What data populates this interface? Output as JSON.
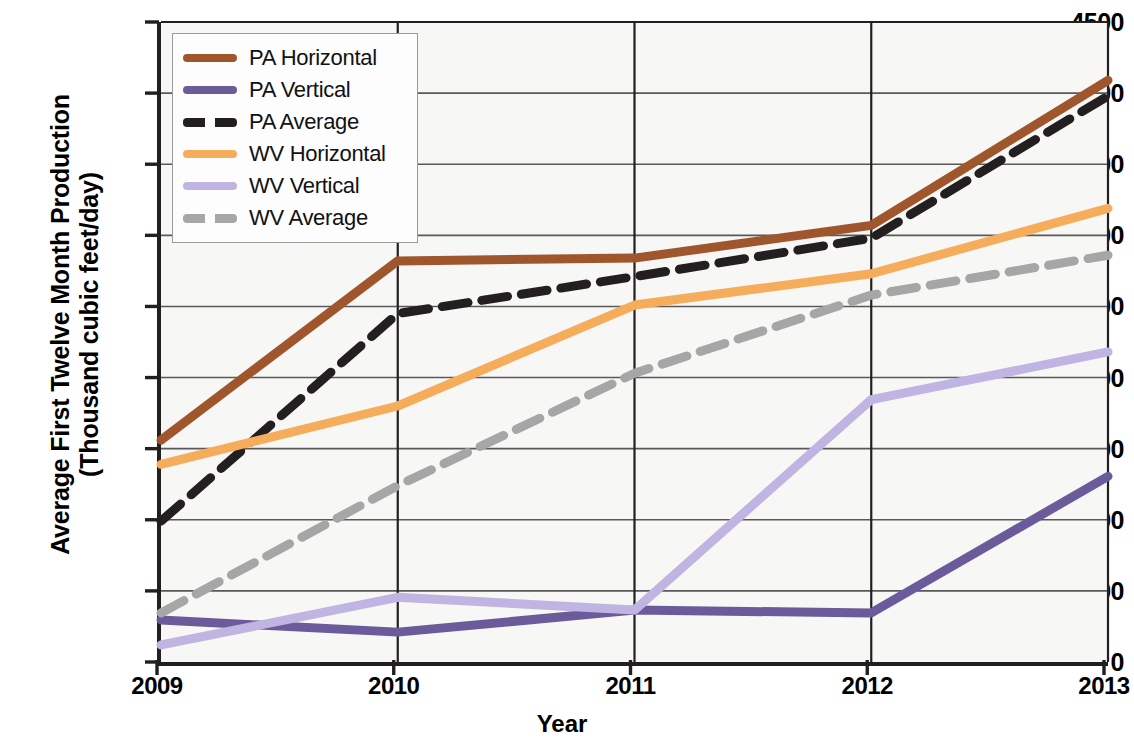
{
  "chart_data": {
    "type": "line",
    "title": "",
    "xlabel": "Year",
    "ylabel": "Average First Twelve Month Production (Thousand cubic feet/day)",
    "ylabel_line1": "Average First Twelve Month Production",
    "ylabel_line2": "(Thousand cubic feet/day)",
    "categories": [
      "2009",
      "2010",
      "2011",
      "2012",
      "2013"
    ],
    "x": [
      2009,
      2010,
      2011,
      2012,
      2013
    ],
    "xlim": [
      2009,
      2013
    ],
    "ylim": [
      0,
      4500
    ],
    "yticks": [
      4500,
      4000,
      3500,
      3000,
      2500,
      2000,
      1500,
      1000,
      500,
      0
    ],
    "ytick_labels": [
      "4500",
      "4000",
      "3500",
      "3000",
      "2500",
      "2000",
      "1500",
      "1000",
      "500",
      "0"
    ],
    "xticks": [
      2009,
      2010,
      2011,
      2012,
      2013
    ],
    "xtick_labels": [
      "2009",
      "2010",
      "2011",
      "2012",
      "2013"
    ],
    "grid": "horizontal",
    "legend_position": "top-left",
    "series": [
      {
        "name": "PA Horizontal",
        "color": "#a0562c",
        "style": "solid",
        "width": 9,
        "values": [
          1560,
          2820,
          2840,
          3070,
          4090
        ]
      },
      {
        "name": "PA Vertical",
        "color": "#6b5b9a",
        "style": "solid",
        "width": 9,
        "values": [
          295,
          210,
          365,
          345,
          1305
        ]
      },
      {
        "name": "PA Average",
        "color": "#231f20",
        "style": "dashed",
        "width": 9,
        "values": [
          990,
          2450,
          2710,
          2980,
          3980
        ]
      },
      {
        "name": "WV Horizontal",
        "color": "#f5ad5c",
        "style": "solid",
        "width": 9,
        "values": [
          1390,
          1800,
          2510,
          2730,
          3190
        ]
      },
      {
        "name": "WV Vertical",
        "color": "#c0b4e2",
        "style": "solid",
        "width": 9,
        "values": [
          120,
          455,
          365,
          1845,
          2180
        ]
      },
      {
        "name": "WV Average",
        "color": "#a6a6a6",
        "style": "dashed",
        "width": 9,
        "values": [
          345,
          1240,
          2030,
          2580,
          2860
        ]
      }
    ]
  },
  "legend": {
    "items": [
      {
        "label": "PA Horizontal",
        "color": "#a0562c",
        "style": "solid"
      },
      {
        "label": "PA Vertical",
        "color": "#6b5b9a",
        "style": "solid"
      },
      {
        "label": "PA Average",
        "color": "#231f20",
        "style": "dashed"
      },
      {
        "label": "WV Horizontal",
        "color": "#f5ad5c",
        "style": "solid"
      },
      {
        "label": "WV Vertical",
        "color": "#c0b4e2",
        "style": "solid"
      },
      {
        "label": "WV Average",
        "color": "#a6a6a6",
        "style": "dashed"
      }
    ]
  }
}
